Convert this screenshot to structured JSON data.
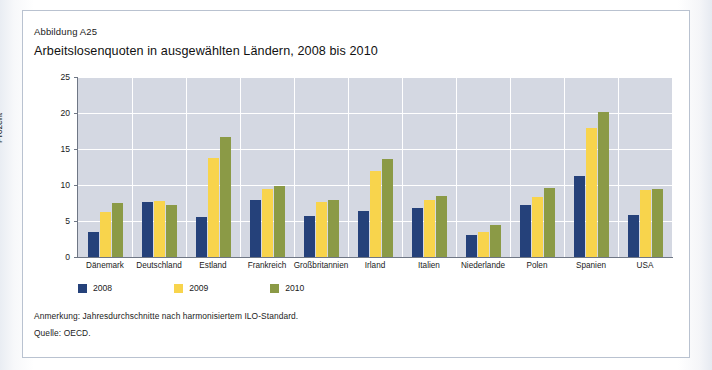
{
  "figure": {
    "kicker": "Abbildung A25",
    "title": "Arbeitslosenquoten in ausgewählten Ländern, 2008 bis 2010"
  },
  "notes": {
    "annotation": "Anmerkung: Jahresdurchschnitte nach harmonisiertem ILO-Standard.",
    "source": "Quelle: OECD."
  },
  "colors": {
    "series_2008": "#25417a",
    "series_2009": "#f8d44c",
    "series_2010": "#8b9a46",
    "plot_background": "#d4d8e2",
    "gridline": "#ffffff",
    "axis": "#6f7785",
    "frame": "#b9c2d0"
  },
  "chart_data": {
    "type": "bar",
    "title": "Arbeitslosenquoten in ausgewählten Ländern, 2008 bis 2010",
    "xlabel": "",
    "ylabel": "Prozent",
    "ylim": [
      0,
      25
    ],
    "yticks": [
      0,
      5,
      10,
      15,
      20,
      25
    ],
    "grid": true,
    "legend_position": "bottom-left",
    "categories": [
      "Dänemark",
      "Deutschland",
      "Estland",
      "Frankreich",
      "Großbritannien",
      "Irland",
      "Italien",
      "Niederlande",
      "Polen",
      "Spanien",
      "USA"
    ],
    "series": [
      {
        "name": "2008",
        "color": "#25417a",
        "values": [
          3.5,
          7.6,
          5.6,
          7.9,
          5.7,
          6.4,
          6.8,
          3.1,
          7.2,
          11.3,
          5.8
        ]
      },
      {
        "name": "2009",
        "color": "#f8d44c",
        "values": [
          6.2,
          7.8,
          13.8,
          9.5,
          7.7,
          11.9,
          7.9,
          3.5,
          8.3,
          17.9,
          9.3
        ]
      },
      {
        "name": "2010",
        "color": "#8b9a46",
        "values": [
          7.5,
          7.2,
          16.7,
          9.8,
          7.9,
          13.6,
          8.5,
          4.4,
          9.6,
          20.1,
          9.5
        ]
      }
    ]
  }
}
